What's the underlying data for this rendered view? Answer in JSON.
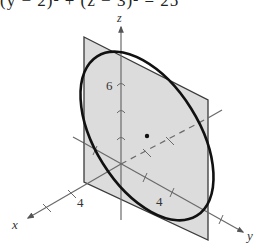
{
  "equation": "(y − 2)² + (z − 3)² = 25",
  "diagram": {
    "type": "3d-surface-sketch",
    "axes": {
      "x_label": "x",
      "y_label": "y",
      "z_label": "z"
    },
    "tick_labels": {
      "x": "4",
      "y": "4",
      "z": "6"
    },
    "center_point": [
      0,
      2,
      3
    ],
    "radius": 5,
    "colors": {
      "plane_fill": "#dcdcdc",
      "plane_edge": "#3a3a3a",
      "curve": "#111111",
      "axis": "#6a6a6a"
    }
  }
}
